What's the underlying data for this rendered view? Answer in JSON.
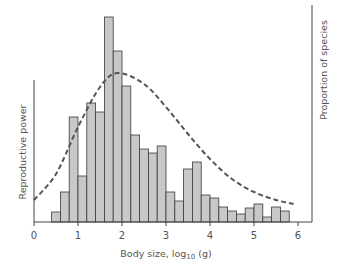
{
  "chart_data": {
    "type": "bar",
    "title": "",
    "xlabel": "Body size, log10 (g)",
    "xlabel_main": "Body size, log",
    "xlabel_sub": "10",
    "xlabel_tail": " (g)",
    "ylabel_left": "Reproductive power",
    "ylabel_right": "Proportion of species",
    "xlim": [
      0,
      6.3
    ],
    "xticks": [
      0,
      1,
      2,
      3,
      4,
      5,
      6
    ],
    "grid": false,
    "legend": "none",
    "bin_width": 0.2,
    "bins_start": [
      0.4,
      0.6,
      0.8,
      1.0,
      1.2,
      1.4,
      1.6,
      1.8,
      2.0,
      2.2,
      2.4,
      2.6,
      2.8,
      3.0,
      3.2,
      3.4,
      3.6,
      3.8,
      4.0,
      4.2,
      4.4,
      4.6,
      4.8,
      5.0,
      5.2,
      5.4,
      5.6
    ],
    "series": [
      {
        "name": "Proportion of species (histogram, relative units)",
        "axis": "right",
        "values": [
          10,
          30,
          105,
          46,
          119,
          110,
          205,
          171,
          136,
          87,
          73,
          69,
          76,
          30,
          21,
          53,
          60,
          27,
          24,
          15,
          11,
          8,
          14,
          18,
          5,
          15,
          11
        ]
      },
      {
        "name": "Reproductive power (dashed curve)",
        "axis": "left",
        "style": "dashed",
        "x": [
          0,
          0.5,
          1.0,
          1.5,
          1.9,
          2.5,
          3.0,
          3.5,
          4.0,
          4.5,
          5.0,
          5.5,
          5.9
        ],
        "values": [
          22,
          48,
          95,
          135,
          149,
          138,
          115,
          88,
          63,
          43,
          30,
          22,
          18
        ]
      }
    ]
  },
  "colors": {
    "bar_fill": "#c8c8c8",
    "bar_stroke": "#3a3a3a",
    "curve": "#555555",
    "axis": "#444444",
    "text": "#555555"
  }
}
